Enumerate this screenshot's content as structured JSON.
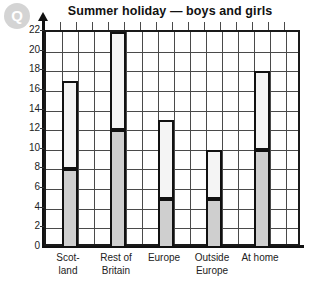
{
  "logo": {
    "text": "Q",
    "name": "q-watermark-logo"
  },
  "chart_data": {
    "type": "bar",
    "subtype": "stacked-bar",
    "title": "Summer holiday — boys and girls",
    "xlabel": "",
    "ylabel": "",
    "categories": [
      "Scot-land",
      "Rest of Britain",
      "Europe",
      "Outside Europe",
      "At home"
    ],
    "category_lines": [
      [
        "Scot-",
        "land"
      ],
      [
        "Rest of",
        "Britain"
      ],
      [
        "Europe"
      ],
      [
        "Outside",
        "Europe"
      ],
      [
        "At home"
      ]
    ],
    "series": [
      {
        "name": "lower",
        "color": "#cfcfcf",
        "values": [
          8,
          12,
          5,
          5,
          10
        ]
      },
      {
        "name": "upper",
        "color": "#f4f4f4",
        "values": [
          9,
          10,
          8,
          5,
          8
        ]
      }
    ],
    "totals": [
      17,
      22,
      13,
      10,
      18
    ],
    "ylim": [
      0,
      22
    ],
    "ytick_step": 2,
    "yticks": [
      "0",
      "2",
      "4",
      "6",
      "8",
      "10",
      "12",
      "14",
      "16",
      "18",
      "20",
      "22"
    ],
    "grid": true,
    "legend": null
  },
  "axis": {
    "zero_label": "0"
  }
}
